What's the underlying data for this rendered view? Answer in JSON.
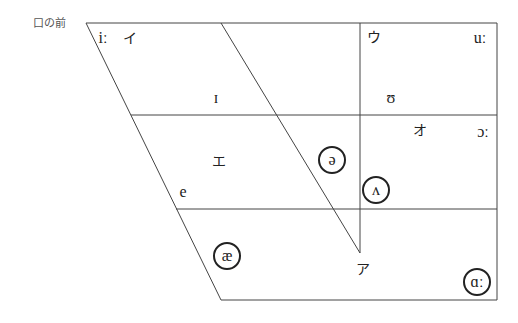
{
  "title": "口の前",
  "colors": {
    "line": "#444444",
    "text": "#222222",
    "label": "#555555"
  },
  "chart_outline": {
    "top_left": [
      86,
      23
    ],
    "top_right": [
      497,
      23
    ],
    "bottom_right": [
      497,
      300
    ],
    "bottom_left": [
      221,
      300
    ]
  },
  "grid_lines": [
    {
      "name": "upper-horizontal-divider",
      "from": [
        131,
        115
      ],
      "to": [
        497,
        115
      ]
    },
    {
      "name": "lower-horizontal-divider",
      "from": [
        176,
        209
      ],
      "to": [
        497,
        209
      ]
    },
    {
      "name": "vertical-divider",
      "from": [
        360,
        23
      ],
      "to": [
        360,
        253
      ]
    },
    {
      "name": "central-diagonal",
      "from": [
        221,
        23
      ],
      "to": [
        360,
        253
      ]
    }
  ],
  "vowels": [
    {
      "name": "vowel-long-i",
      "symbol": "iː",
      "x": 103,
      "y": 38,
      "circled": false,
      "kana": false
    },
    {
      "name": "kana-i",
      "symbol": "イ",
      "x": 130,
      "y": 38,
      "circled": false,
      "kana": true
    },
    {
      "name": "kana-u",
      "symbol": "ウ",
      "x": 374,
      "y": 37,
      "circled": false,
      "kana": true
    },
    {
      "name": "vowel-long-u",
      "symbol": "uː",
      "x": 480,
      "y": 38,
      "circled": false,
      "kana": false
    },
    {
      "name": "vowel-short-i",
      "symbol": "ɪ",
      "x": 216,
      "y": 98,
      "circled": false,
      "kana": false
    },
    {
      "name": "vowel-short-u",
      "symbol": "ʊ",
      "x": 391,
      "y": 98,
      "circled": false,
      "kana": false
    },
    {
      "name": "kana-o",
      "symbol": "オ",
      "x": 420,
      "y": 130,
      "circled": false,
      "kana": true
    },
    {
      "name": "vowel-long-open-o",
      "symbol": "ɔː",
      "x": 483,
      "y": 132,
      "circled": false,
      "kana": false
    },
    {
      "name": "kana-e",
      "symbol": "エ",
      "x": 219,
      "y": 161,
      "circled": false,
      "kana": true
    },
    {
      "name": "vowel-schwa",
      "symbol": "ə",
      "x": 332,
      "y": 160,
      "circled": true,
      "kana": false
    },
    {
      "name": "vowel-e",
      "symbol": "e",
      "x": 183,
      "y": 192,
      "circled": false,
      "kana": false
    },
    {
      "name": "vowel-wedge",
      "symbol": "ʌ",
      "x": 376,
      "y": 190,
      "circled": true,
      "kana": false
    },
    {
      "name": "vowel-ash",
      "symbol": "æ",
      "x": 227,
      "y": 256,
      "circled": true,
      "kana": false
    },
    {
      "name": "kana-a",
      "symbol": "ア",
      "x": 363,
      "y": 269,
      "circled": false,
      "kana": true
    },
    {
      "name": "vowel-long-a",
      "symbol": "ɑː",
      "x": 477,
      "y": 282,
      "circled": true,
      "kana": false
    }
  ]
}
